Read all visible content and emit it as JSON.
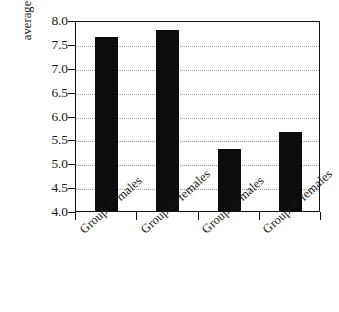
{
  "chart_data": {
    "type": "bar",
    "title": "",
    "xlabel": "",
    "ylabel": "average HbA1C (%)",
    "categories": [
      "Group 1: males",
      "Group 2: females",
      "Group 3: males",
      "Group 4: females"
    ],
    "values": [
      7.65,
      7.8,
      5.3,
      5.65
    ],
    "ylim": [
      4.0,
      8.0
    ],
    "ytick_labels": [
      "8.0",
      "7.5",
      "7.0",
      "6.5",
      "6.0",
      "5.5",
      "5.0",
      "4.5",
      "4.0"
    ],
    "ytick_values": [
      8.0,
      7.5,
      7.0,
      6.5,
      6.0,
      5.5,
      5.0,
      4.5,
      4.0
    ],
    "gridlines": [
      7.5,
      7.0,
      6.5,
      6.0,
      5.5,
      5.0,
      4.5
    ],
    "grid": true,
    "legend": "none",
    "bar_color": "#0d0d0d",
    "frame_color": "#111111",
    "grid_color": "#9a9a9a",
    "background": "#ffffff"
  }
}
